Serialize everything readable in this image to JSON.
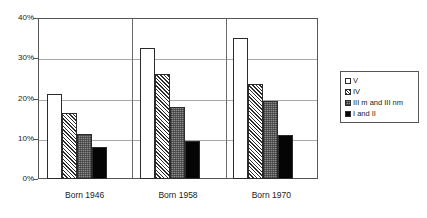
{
  "chart_data": {
    "type": "bar",
    "title": "",
    "subtitle": "",
    "xlabel": "",
    "ylabel": "",
    "categories": [
      "Born 1946",
      "Born 1958",
      "Born 1970"
    ],
    "series": [
      {
        "name": "V",
        "values": [
          21.0,
          32.5,
          35.0
        ],
        "fill": "white",
        "color": "#ffffff"
      },
      {
        "name": "IV",
        "values": [
          16.5,
          26.0,
          23.5
        ],
        "fill": "diagonal-hatch",
        "color": "#2b2b2b"
      },
      {
        "name": "III m and III nm",
        "values": [
          11.3,
          18.0,
          19.5
        ],
        "fill": "gray-stipple",
        "color": "#8c8c8c"
      },
      {
        "name": "I and II",
        "values": [
          8.0,
          9.5,
          11.0
        ],
        "fill": "solid-black",
        "color": "#050505"
      }
    ],
    "ylim": [
      0,
      40
    ],
    "yticks": [
      0,
      10,
      20,
      30,
      40
    ],
    "ytick_labels": [
      "0%",
      "10%",
      "20%",
      "30%",
      "40%"
    ],
    "grid": true,
    "grid_axis": "y",
    "legend_position": "right",
    "legend_border": true,
    "value_suffix": "%",
    "frame_color": "#555555",
    "gridline_color": "#a8a8a8"
  },
  "legend": {
    "entries": [
      {
        "label": "V"
      },
      {
        "label": "IV"
      },
      {
        "label": "III m and III nm"
      },
      {
        "label": "I and II"
      }
    ]
  }
}
